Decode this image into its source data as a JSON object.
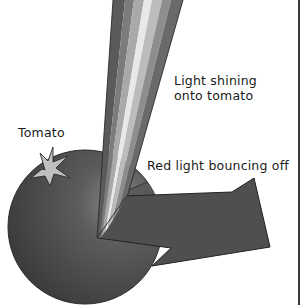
{
  "diagram": {
    "labels": {
      "light_in": [
        "Light shining",
        "onto tomato"
      ],
      "light_out": "Red light bouncing off",
      "object": "Tomato"
    },
    "elements": [
      {
        "id": "light-beam",
        "description": "Multi-band beam of white light shining down onto tomato"
      },
      {
        "id": "tomato",
        "description": "Round tomato with star-shaped leafy calyx"
      },
      {
        "id": "reflected-arrow",
        "description": "Arrow of red light bouncing off the tomato to the right"
      }
    ],
    "colors": {
      "tomato": "#4a4a4a",
      "arrow": "#4e4e4e",
      "leaf": "#bdbdbd",
      "beam_bands": [
        "#5a5a5a",
        "#7a7a7a",
        "#a8a8a8",
        "#e6e6e6",
        "#b8b8b8",
        "#8c8c8c",
        "#6a6a6a"
      ],
      "border": "#3a3a3a"
    }
  }
}
